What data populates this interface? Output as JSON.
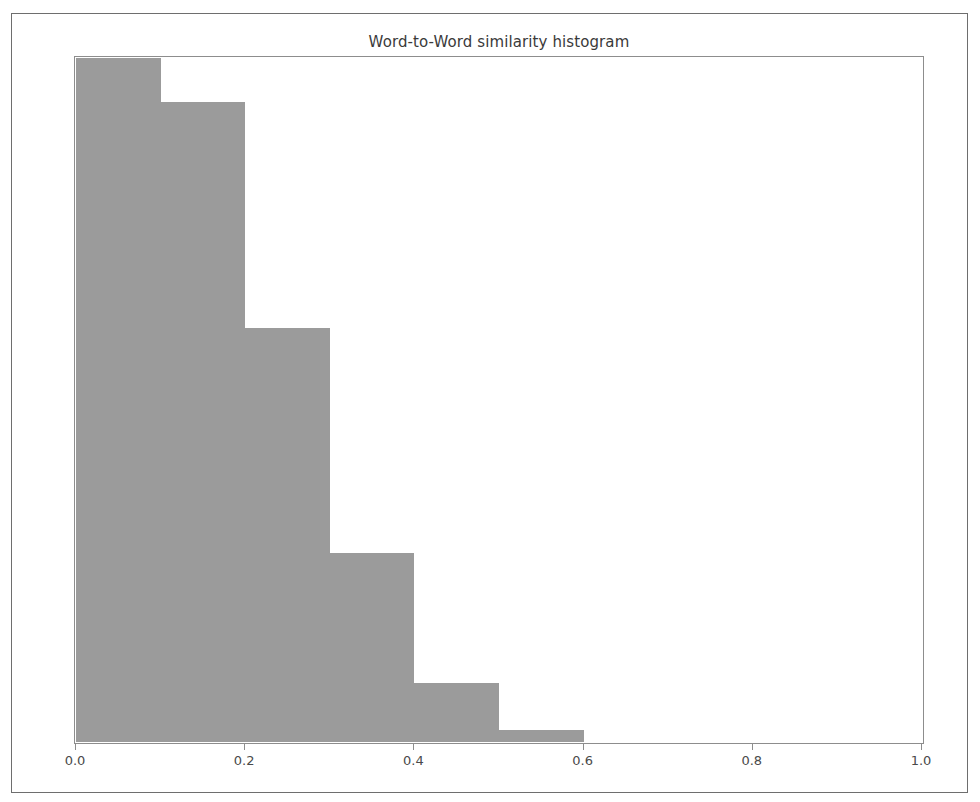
{
  "chart_data": {
    "type": "bar",
    "title": "Word-to-Word similarity histogram",
    "xlabel": "",
    "ylabel": "",
    "grid": false,
    "legend": null,
    "legend_position": "none",
    "xlim": [
      0.0,
      1.0
    ],
    "ylim_note": "y-axis has no tick labels; heights shown as normalized fraction of tallest bin",
    "xticks": [
      0.0,
      0.2,
      0.4,
      0.6,
      0.8,
      1.0
    ],
    "xtick_labels": [
      "0.0",
      "0.2",
      "0.4",
      "0.6",
      "0.8",
      "1.0"
    ],
    "yticks": [],
    "ytick_labels": [],
    "bin_width": 0.1,
    "bin_edges": [
      0.0,
      0.1,
      0.2,
      0.3,
      0.4,
      0.5,
      0.6,
      0.7,
      0.8,
      0.9,
      1.0
    ],
    "categories": [
      "0.0-0.1",
      "0.1-0.2",
      "0.2-0.3",
      "0.3-0.4",
      "0.4-0.5",
      "0.5-0.6",
      "0.6-0.7",
      "0.7-0.8",
      "0.8-0.9",
      "0.9-1.0"
    ],
    "bin_starts": [
      0.0,
      0.1,
      0.2,
      0.3,
      0.4,
      0.5,
      0.6,
      0.7,
      0.8,
      0.9
    ],
    "values": [
      1.0,
      0.936,
      0.606,
      0.277,
      0.087,
      0.018,
      0.0,
      0.0,
      0.0,
      0.0
    ],
    "bar_color": "#9b9b9b",
    "axes_edge_color": "#8d8d8d",
    "frame_color": "#6e6e6e",
    "background_color": "#ffffff"
  },
  "figure": {
    "title": "Word-to-Word similarity histogram"
  }
}
